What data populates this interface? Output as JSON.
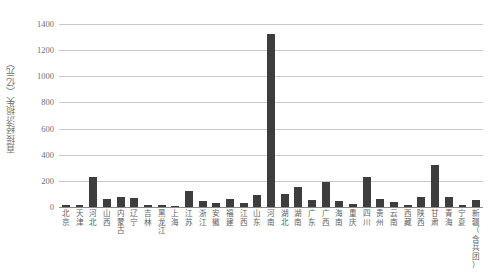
{
  "chart_data": {
    "type": "bar",
    "title": "",
    "subtitle": "",
    "xlabel": "",
    "ylabel": "直接经济损失（亿元）",
    "ylim": [
      0,
      1400
    ],
    "yticks": [
      0,
      200,
      400,
      600,
      800,
      1000,
      1200,
      1400
    ],
    "ytick_labels": [
      "0",
      "200",
      "400",
      "600",
      "800",
      "1000",
      "1200",
      "1400"
    ],
    "grid": true,
    "legend": null,
    "bar_color": "#3d3d3d",
    "grid_color": "#c8c8c8",
    "categories": [
      "北京",
      "天津",
      "河北",
      "山西",
      "内蒙古",
      "辽宁",
      "吉林",
      "黑龙江",
      "上海",
      "江苏",
      "浙江",
      "安徽",
      "福建",
      "江西",
      "山东",
      "河南",
      "湖北",
      "湖南",
      "广东",
      "广西",
      "海南",
      "重庆",
      "四川",
      "贵州",
      "云南",
      "西藏",
      "陕西",
      "甘肃",
      "青海",
      "宁夏",
      "新疆（含兵团）"
    ],
    "values": [
      12,
      18,
      230,
      60,
      75,
      70,
      14,
      16,
      8,
      125,
      45,
      30,
      60,
      28,
      95,
      1320,
      100,
      150,
      55,
      195,
      45,
      25,
      230,
      60,
      38,
      15,
      80,
      325,
      75,
      18,
      55
    ]
  }
}
